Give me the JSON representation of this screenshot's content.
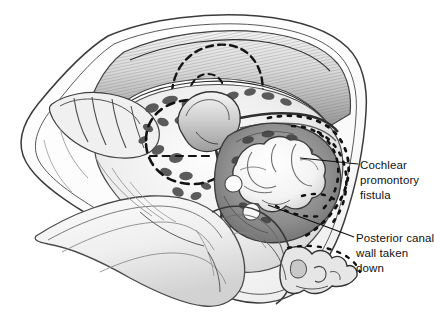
{
  "figure": {
    "type": "medical-illustration",
    "style": "grayscale pen-and-ink surgical drawing",
    "background_color": "#ffffff",
    "ink_color": "#111111"
  },
  "annotations": [
    {
      "id": "cochlear-promontory-fistula",
      "lines": [
        "Cochlear",
        "promontory",
        "fistula"
      ],
      "leader": {
        "from_x": 358,
        "from_y": 164,
        "to_x": 300,
        "to_y": 158
      }
    },
    {
      "id": "posterior-canal-wall-taken-down",
      "lines": [
        "Posterior canal",
        "wall taken",
        "down"
      ],
      "leader": {
        "from_x": 354,
        "from_y": 237,
        "to_x": 268,
        "to_y": 205
      }
    }
  ],
  "structures": [
    {
      "name": "mastoid-cavity-rim",
      "tone": "#f2f2f2"
    },
    {
      "name": "hatched-superior-wall",
      "tone": "#9a9a9a"
    },
    {
      "name": "lateral-semicircular-canal-dashed",
      "tone": "#1a1a1a"
    },
    {
      "name": "facial-nerve-ridge",
      "tone": "#b9b9b9"
    },
    {
      "name": "ossicular-remnant",
      "tone": "#cfcfcf"
    },
    {
      "name": "cholesteatoma-mass",
      "tone": "#fbfbfb"
    },
    {
      "name": "promontory-recess",
      "tone": "#8c8c8c"
    },
    {
      "name": "posterior-canal-wall-dotted-outline",
      "tone": "#1a1a1a"
    },
    {
      "name": "external-canal-floor",
      "tone": "#e8e8e8"
    },
    {
      "name": "scalloped-bone-edge",
      "tone": "#d8d8d8"
    }
  ],
  "colors": {
    "paper": "#ffffff",
    "ink": "#111111",
    "mid_gray": "#9a9a9a",
    "dark_gray": "#4a4a4a",
    "light_gray": "#e3e3e3",
    "highlight": "#fdfdfd"
  }
}
